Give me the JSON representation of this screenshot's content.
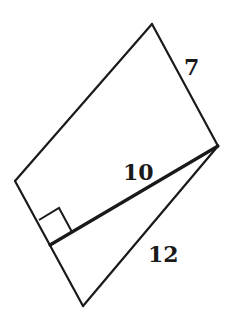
{
  "diagram": {
    "type": "geometry",
    "vertices": {
      "top": [
        152,
        24
      ],
      "right": [
        218,
        146
      ],
      "left": [
        15,
        181
      ],
      "foot": [
        50,
        245
      ],
      "bottom": [
        83,
        306
      ]
    },
    "right_angle_mark": [
      [
        39,
        220
      ],
      [
        59,
        208
      ],
      [
        72,
        230
      ],
      [
        50,
        245
      ]
    ],
    "labels": {
      "side_top_right": "7",
      "diagonal": "10",
      "side_bottom_right": "12"
    },
    "colors": {
      "stroke": "#1a1a1a",
      "background": "#ffffff"
    }
  }
}
